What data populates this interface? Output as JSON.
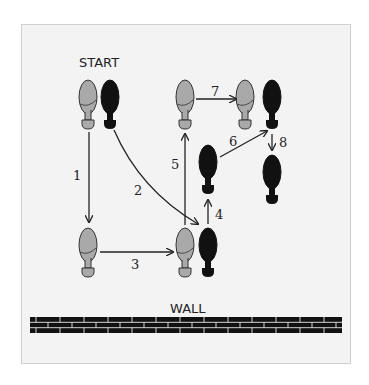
{
  "title_label": "START",
  "wall_label": "WALL",
  "colors": {
    "background": "#f3f3f3",
    "left_foot": "#a9a9a9",
    "right_foot": "#111111",
    "arrow": "#222222",
    "wall": "#111111",
    "mortar": "#f3f3f3"
  },
  "steps": [
    {
      "number": "1",
      "description": "Left foot moves straight down"
    },
    {
      "number": "2",
      "description": "Right foot curves down to beside the left foot"
    },
    {
      "number": "3",
      "description": "Left foot moves right"
    },
    {
      "number": "4",
      "description": "Right foot moves up"
    },
    {
      "number": "5",
      "description": "Left foot moves up"
    },
    {
      "number": "6",
      "description": "Right foot moves diagonally up-right"
    },
    {
      "number": "7",
      "description": "Left foot moves right"
    },
    {
      "number": "8",
      "description": "Right foot moves down"
    }
  ],
  "feet": [
    {
      "id": "start-left",
      "side": "left",
      "x": 88,
      "y": 80
    },
    {
      "id": "start-right",
      "side": "right",
      "x": 110,
      "y": 80
    },
    {
      "id": "step1-left",
      "side": "left",
      "x": 88,
      "y": 228
    },
    {
      "id": "step3-left",
      "side": "left",
      "x": 185,
      "y": 228
    },
    {
      "id": "step2-right",
      "side": "right",
      "x": 208,
      "y": 228
    },
    {
      "id": "step4-right",
      "side": "right",
      "x": 208,
      "y": 145
    },
    {
      "id": "step5-left",
      "side": "left",
      "x": 185,
      "y": 80
    },
    {
      "id": "step7-left",
      "side": "left",
      "x": 245,
      "y": 80
    },
    {
      "id": "step6-right",
      "side": "right",
      "x": 272,
      "y": 80
    },
    {
      "id": "step8-right",
      "side": "right",
      "x": 272,
      "y": 155
    }
  ]
}
